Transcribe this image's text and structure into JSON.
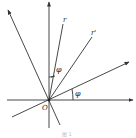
{
  "diagram": {
    "type": "rotated coordinate axes",
    "labels": {
      "origin": "O",
      "vector_r": "r",
      "vector_r_prime": "r'",
      "angle_between_y_and_r": "φ",
      "angle_between_x_and_x_prime": "φ"
    },
    "caption": "图 1",
    "colors": {
      "line": "#333333",
      "background": "#ffffff"
    }
  }
}
